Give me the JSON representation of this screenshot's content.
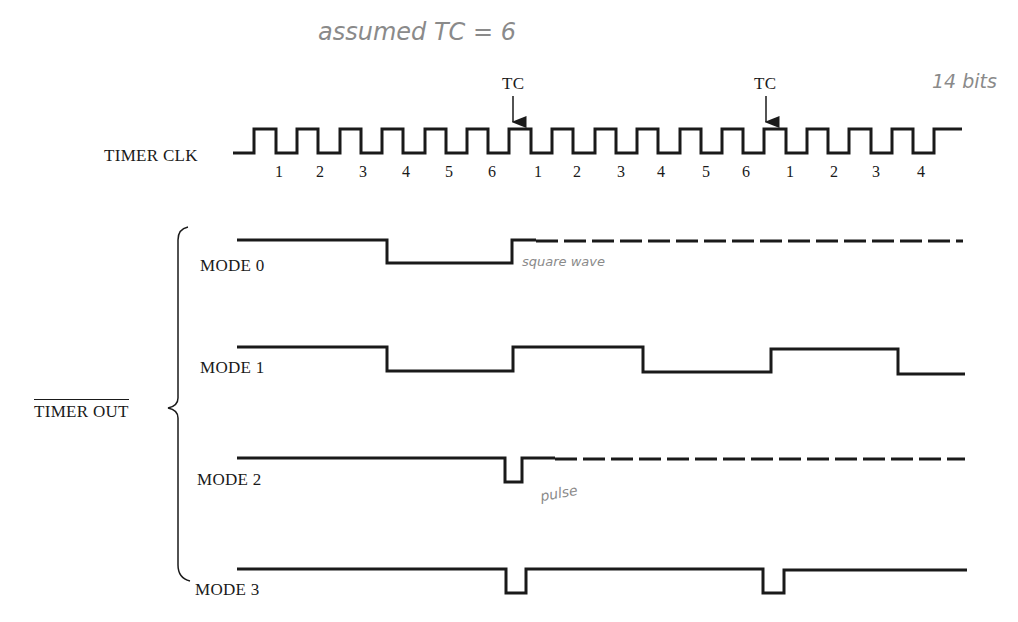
{
  "annotations": {
    "top_note": "assumed TC = 6",
    "bits_note": "14 bits",
    "mode0_note": "square wave",
    "mode2_note": "pulse"
  },
  "clock": {
    "label": "TIMER CLK",
    "tc_label": "TC",
    "tick_labels": [
      "1",
      "2",
      "3",
      "4",
      "5",
      "6",
      "1",
      "2",
      "3",
      "4",
      "5",
      "6",
      "1",
      "2",
      "3",
      "4"
    ]
  },
  "output": {
    "label": "TIMER OUT",
    "label_overbar": true,
    "modes": [
      {
        "label": "MODE 0",
        "description": "Goes low at count 3 edge, returns high at TC, then continues as square wave (dashed)"
      },
      {
        "label": "MODE 1",
        "description": "Square wave toggling every 3 counts"
      },
      {
        "label": "MODE 2",
        "description": "Single short low pulse at TC, then repeats (dashed)"
      },
      {
        "label": "MODE 3",
        "description": "Short low pulse at each TC"
      }
    ]
  },
  "colors": {
    "line": "#1a1a1a",
    "handwriting": "#8a8a8a",
    "background": "#ffffff"
  }
}
